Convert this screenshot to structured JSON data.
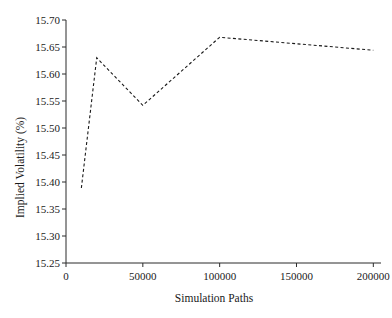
{
  "chart_data": {
    "type": "line",
    "title": "",
    "xlabel": "Simulation Paths",
    "ylabel": "Implied Volatility (%)",
    "x": [
      10000,
      20000,
      50000,
      100000,
      200000
    ],
    "values": [
      15.389,
      15.63,
      15.542,
      15.668,
      15.644
    ],
    "series": [
      {
        "name": "Implied Volatility",
        "x": [
          10000,
          20000,
          50000,
          100000,
          200000
        ],
        "values": [
          15.389,
          15.63,
          15.542,
          15.668,
          15.644
        ]
      }
    ],
    "xlim": [
      0,
      205000
    ],
    "ylim": [
      15.25,
      15.7
    ],
    "xticks": [
      0,
      50000,
      100000,
      150000,
      200000
    ],
    "xtick_labels": [
      "0",
      "50000",
      "100000",
      "150000",
      "200000"
    ],
    "yticks": [
      15.25,
      15.3,
      15.35,
      15.4,
      15.45,
      15.5,
      15.55,
      15.6,
      15.65,
      15.7
    ],
    "ytick_labels": [
      "15.25",
      "15.30",
      "15.35",
      "15.40",
      "15.45",
      "15.50",
      "15.55",
      "15.60",
      "15.65",
      "15.70"
    ],
    "grid": false,
    "legend": null,
    "line_style": "dashed",
    "line_color": "#1a1a1a",
    "axis_color": "#2b2b2b",
    "background_color": "#ffffff",
    "annotations": []
  }
}
